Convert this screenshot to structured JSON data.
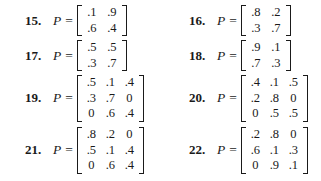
{
  "problems": [
    {
      "number": "15.",
      "variable": "P",
      "equals": "=",
      "rows": [
        [
          ".1",
          ".9"
        ],
        [
          ".6",
          ".4"
        ]
      ]
    },
    {
      "number": "16.",
      "variable": "P",
      "equals": "=",
      "rows": [
        [
          ".8",
          ".2"
        ],
        [
          ".3",
          ".7"
        ]
      ]
    },
    {
      "number": "17.",
      "variable": "P",
      "equals": "=",
      "rows": [
        [
          ".5",
          ".5"
        ],
        [
          ".3",
          ".7"
        ]
      ]
    },
    {
      "number": "18.",
      "variable": "P",
      "equals": "=",
      "rows": [
        [
          ".9",
          ".1"
        ],
        [
          ".7",
          ".3"
        ]
      ]
    },
    {
      "number": "19.",
      "variable": "P",
      "equals": "=",
      "rows": [
        [
          ".5",
          ".1",
          ".4"
        ],
        [
          ".3",
          ".7",
          "0"
        ],
        [
          "0",
          ".6",
          ".4"
        ]
      ]
    },
    {
      "number": "20.",
      "variable": "P",
      "equals": "=",
      "rows": [
        [
          ".4",
          ".1",
          ".5"
        ],
        [
          ".2",
          ".8",
          "0"
        ],
        [
          "0",
          ".5",
          ".5"
        ]
      ]
    },
    {
      "number": "21.",
      "variable": "P",
      "equals": "=",
      "rows": [
        [
          ".8",
          ".2",
          "0"
        ],
        [
          ".5",
          ".1",
          ".4"
        ],
        [
          "0",
          ".6",
          ".4"
        ]
      ]
    },
    {
      "number": "22.",
      "variable": "P",
      "equals": "=",
      "rows": [
        [
          ".2",
          ".8",
          "0"
        ],
        [
          ".6",
          ".1",
          ".3"
        ],
        [
          "0",
          ".9",
          ".1"
        ]
      ]
    }
  ]
}
